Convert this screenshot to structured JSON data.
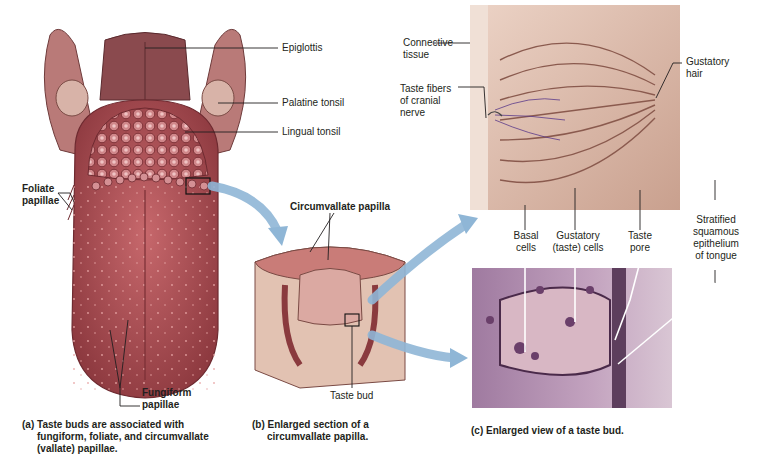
{
  "figure": {
    "panels": {
      "a": {
        "caption_prefix": "(a)",
        "caption_lines": [
          "Taste buds are associated with",
          "fungiform, foliate, and circumvallate",
          "(vallate) papillae."
        ],
        "labels": {
          "epiglottis": "Epiglottis",
          "palatine_tonsil": "Palatine tonsil",
          "lingual_tonsil": "Lingual tonsil",
          "foliate_papillae": [
            "Foliate",
            "papillae"
          ],
          "fungiform_papillae": [
            "Fungiform",
            "papillae"
          ]
        }
      },
      "b": {
        "caption_prefix": "(b)",
        "caption_lines": [
          "Enlarged section of a",
          "circumvallate papilla."
        ],
        "labels": {
          "circumvallate_papilla": "Circumvallate papilla",
          "taste_bud": "Taste bud"
        }
      },
      "c": {
        "caption_prefix": "(c)",
        "caption_lines": [
          "Enlarged view of a taste bud."
        ],
        "labels": {
          "connective_tissue": [
            "Connective",
            "tissue"
          ],
          "taste_fibers": [
            "Taste fibers",
            "of cranial",
            "nerve"
          ],
          "gustatory_hair": [
            "Gustatory",
            "hair"
          ],
          "basal_cells": [
            "Basal",
            "cells"
          ],
          "gustatory_cells": [
            "Gustatory",
            "(taste) cells"
          ],
          "taste_pore": [
            "Taste",
            "pore"
          ],
          "stratified_epithelium": [
            "Stratified",
            "squamous",
            "epithelium",
            "of tongue"
          ]
        }
      }
    },
    "colors": {
      "tongue": "#b85a5e",
      "tongue_dark": "#8e3a40",
      "tonsil": "#c98a84",
      "arrow": "#8fb6d6",
      "illustration_bg": "#e6c7b8",
      "histology_bg": "#b89ab8",
      "text": "#231f20"
    }
  }
}
